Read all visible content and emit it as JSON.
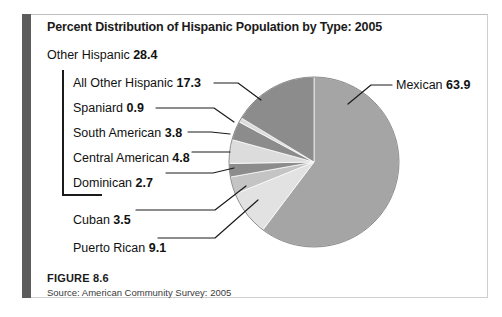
{
  "figure": {
    "title": "Percent Distribution of Hispanic Population by Type: 2005",
    "number": "FIGURE 8.6",
    "source": "Source: American Community Survey: 2005"
  },
  "colors": {
    "mexican": "#a5a5a5",
    "all_other_hispanic": "#8c8c8c",
    "spaniard": "#dcdcdc",
    "south_american": "#8c8c8c",
    "central_american": "#dcdcdc",
    "dominican": "#8c8c8c",
    "cuban": "#c4c4c4",
    "puerto_rican": "#e2e2e2",
    "leader_line": "#1b1b1b",
    "left_rule": "#5c5c5c",
    "text": "#111111"
  },
  "labels": {
    "other_hispanic": {
      "name": "Other Hispanic",
      "value": "28.4"
    },
    "all_other_hispanic": {
      "name": "All Other Hispanic",
      "value": "17.3"
    },
    "spaniard": {
      "name": "Spaniard",
      "value": "0.9"
    },
    "south_american": {
      "name": "South American",
      "value": "3.8"
    },
    "central_american": {
      "name": "Central American",
      "value": "4.8"
    },
    "dominican": {
      "name": "Dominican",
      "value": "2.7"
    },
    "cuban": {
      "name": "Cuban",
      "value": "3.5"
    },
    "puerto_rican": {
      "name": "Puerto Rican",
      "value": "9.1"
    },
    "mexican": {
      "name": "Mexican",
      "value": "63.9"
    }
  },
  "chart_data": {
    "type": "pie",
    "title": "Percent Distribution of Hispanic Population by Type: 2005",
    "unit": "percent",
    "legend_position": "callout-labels",
    "grid": false,
    "center": {
      "x": 314,
      "y": 162
    },
    "radius": 85,
    "start_angle_deg": 0,
    "direction": "clockwise",
    "categories": [
      "Mexican",
      "Puerto Rican",
      "Cuban",
      "Dominican",
      "Central American",
      "South American",
      "Spaniard",
      "All Other Hispanic"
    ],
    "values": [
      63.9,
      9.1,
      3.5,
      2.7,
      4.8,
      3.8,
      0.9,
      17.3
    ],
    "colors": [
      "#a5a5a5",
      "#e2e2e2",
      "#c4c4c4",
      "#8c8c8c",
      "#dcdcdc",
      "#8c8c8c",
      "#dcdcdc",
      "#8c8c8c"
    ],
    "groups": [
      {
        "name": "Other Hispanic",
        "value": 28.4,
        "members": [
          "All Other Hispanic",
          "Spaniard",
          "South American",
          "Central American",
          "Dominican"
        ]
      }
    ],
    "total": 105.99999999999999
  }
}
